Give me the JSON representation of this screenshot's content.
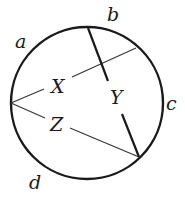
{
  "diagram": {
    "type": "circle-geometry",
    "circle": {
      "cx": 87,
      "cy": 103,
      "r": 76,
      "stroke": "#1a1a1a"
    },
    "arc_labels": [
      {
        "id": "a",
        "text": "a",
        "x": 15,
        "y": 48,
        "size": 19
      },
      {
        "id": "b",
        "text": "b",
        "x": 107,
        "y": 21,
        "size": 19
      },
      {
        "id": "c",
        "text": "c",
        "x": 166,
        "y": 110,
        "size": 19
      },
      {
        "id": "d",
        "text": "d",
        "x": 29,
        "y": 189,
        "size": 19
      }
    ],
    "segment_labels": [
      {
        "id": "X",
        "text": "X",
        "x": 51,
        "y": 93,
        "size": 19
      },
      {
        "id": "Y",
        "text": "Y",
        "x": 110,
        "y": 104,
        "size": 19
      },
      {
        "id": "Z",
        "text": "Z",
        "x": 50,
        "y": 131,
        "size": 19
      }
    ],
    "points": {
      "left_vertex": [
        11,
        103
      ],
      "top_chord_end": [
        88,
        28
      ],
      "upper_right_end": [
        136,
        48
      ],
      "lower_right_vertex": [
        139,
        157
      ]
    }
  }
}
